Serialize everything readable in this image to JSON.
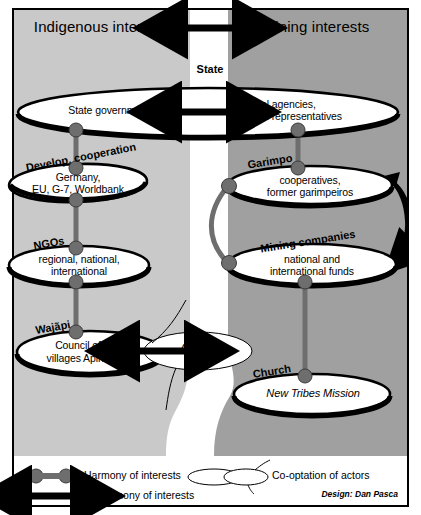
{
  "diagram": {
    "title_banner": {
      "left": "Indigenous interests",
      "right": "Mining interests",
      "center_arrow": "disharmony-arrow"
    },
    "corridor_label": "State",
    "nodes": [
      {
        "id": "state",
        "category": "State",
        "left_text": "State government",
        "right_text_line1": "Federal agencies,",
        "right_text_line2": "Federal representatives",
        "arrow": "disharmony-arrow"
      },
      {
        "id": "development-cooperation",
        "category": "Develop. cooperation",
        "line1": "Germany,",
        "line2": "EU, G-7, Worldbank"
      },
      {
        "id": "ngos",
        "category": "NGOs",
        "line1": "regional, national,",
        "line2": "international"
      },
      {
        "id": "wajapi",
        "category": "Wajãpi",
        "line1": "Council of",
        "line2_plain": "villages ",
        "line2_italic": "Apina",
        "coopted_label": "Apiwata"
      },
      {
        "id": "garimpo",
        "category": "Garimpo",
        "line1": "cooperatives,",
        "line2": "former garimpeiros"
      },
      {
        "id": "mining-companies",
        "category": "Mining companies",
        "line1": "national and",
        "line2": "international funds"
      },
      {
        "id": "church",
        "category": "Church",
        "line1": "New Tribes Mission"
      }
    ],
    "legend": [
      {
        "id": "harmony",
        "symbol": "harmony-connector-icon",
        "label": "Harmony of interests"
      },
      {
        "id": "disharmony",
        "symbol": "disharmony-arrow-icon",
        "label": "Disharmony of interests"
      },
      {
        "id": "cooptation",
        "symbol": "cooptation-overlap-icon",
        "label": "Co-optation of actors"
      }
    ],
    "credit": "Design: Dan Pasca",
    "colors": {
      "indigenous_band": "#c9c9c9",
      "mining_band": "#a0a0a0",
      "corridor": "#ffffff",
      "ink": "#000000",
      "connector_gray": "#6e6e6e",
      "node_fill": "#ffffff"
    }
  }
}
